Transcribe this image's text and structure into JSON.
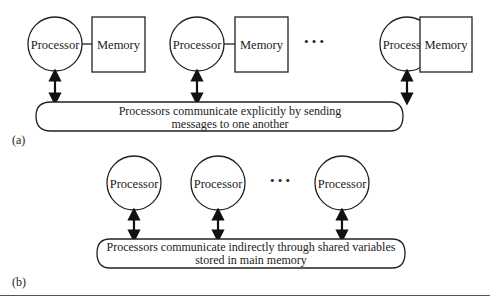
{
  "figure_a": {
    "label": "(a)",
    "processors": [
      {
        "label": "Processor",
        "memory": "Memory"
      },
      {
        "label": "Processor",
        "memory": "Memory"
      },
      {
        "label": "Processor",
        "memory": "Memory"
      }
    ],
    "ellipsis": "• • •",
    "bus_text_line1": "Processors communicate explicitly by sending",
    "bus_text_line2": "messages to one another"
  },
  "figure_b": {
    "label": "(b)",
    "processors": [
      {
        "label": "Processor"
      },
      {
        "label": "Processor"
      },
      {
        "label": "Processor"
      }
    ],
    "ellipsis": "• • •",
    "bus_text_line1": "Processors communicate indirectly through shared variables",
    "bus_text_line2": "stored in main memory"
  },
  "colors": {
    "stroke": "#222222",
    "background": "#ffffff"
  }
}
